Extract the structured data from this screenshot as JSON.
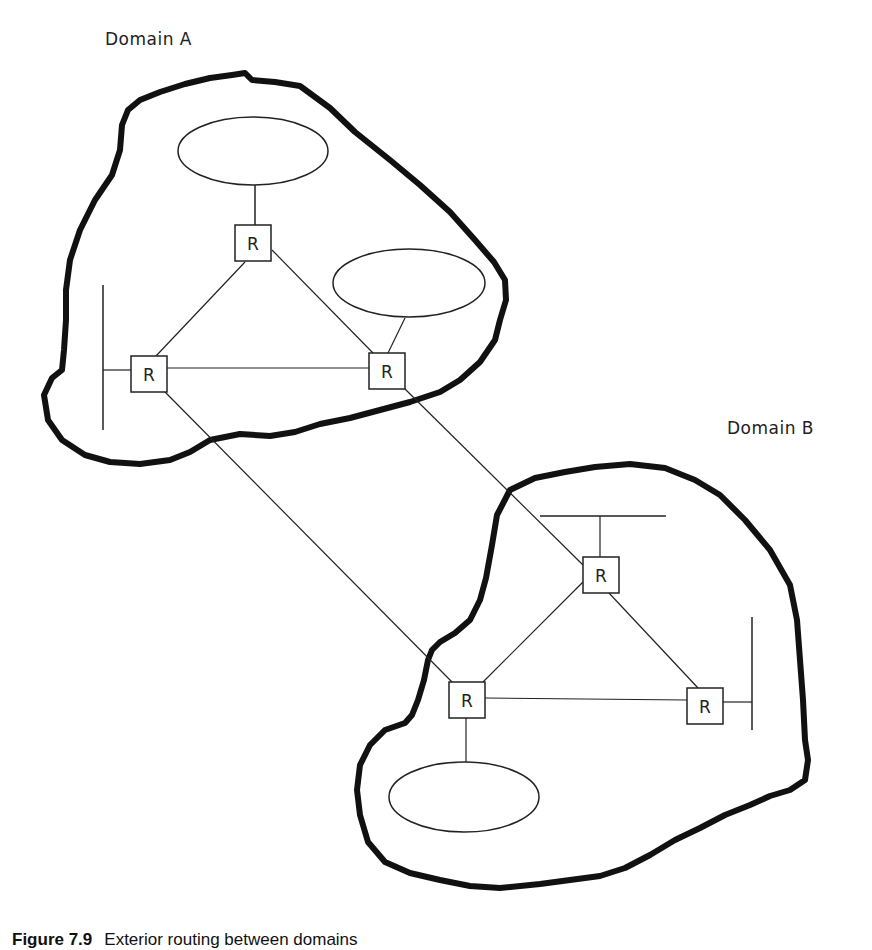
{
  "domains": [
    {
      "id": "A",
      "label": "Domain A"
    },
    {
      "id": "B",
      "label": "Domain B"
    }
  ],
  "router_label": "R",
  "routers": [
    {
      "id": "A-top",
      "domain": "A",
      "x": 235,
      "y": 225
    },
    {
      "id": "A-left",
      "domain": "A",
      "x": 131,
      "y": 356
    },
    {
      "id": "A-right",
      "domain": "A",
      "x": 369,
      "y": 353
    },
    {
      "id": "B-top",
      "domain": "B",
      "x": 583,
      "y": 557
    },
    {
      "id": "B-left",
      "domain": "B",
      "x": 449,
      "y": 682
    },
    {
      "id": "B-right",
      "domain": "B",
      "x": 687,
      "y": 688
    }
  ],
  "caption": {
    "figure": "Figure 7.9",
    "text": "Exterior routing between domains"
  },
  "colors": {
    "stroke": "#111111",
    "background": "#ffffff"
  }
}
